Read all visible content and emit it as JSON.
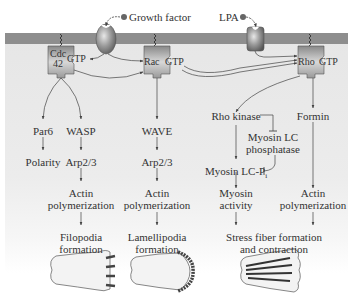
{
  "ligands": {
    "growth_factor": "Growth factor",
    "lpa": "LPA"
  },
  "gtpases": {
    "cdc42": {
      "name_line1": "Cdc",
      "name_line2": "42",
      "state": "GTP"
    },
    "rac": {
      "name": "Rac",
      "state": "GTP"
    },
    "rho": {
      "name": "Rho",
      "state": "GTP"
    }
  },
  "cdc42_pathway": {
    "par6": "Par6",
    "polarity": "Polarity",
    "wasp": "WASP",
    "arp23": "Arp2/3",
    "actin_line1": "Actin",
    "actin_line2": "polymerization",
    "outcome_line1": "Filopodia",
    "outcome_line2": "formation"
  },
  "rac_pathway": {
    "wave": "WAVE",
    "arp23": "Arp2/3",
    "actin_line1": "Actin",
    "actin_line2": "polymerization",
    "outcome_line1": "Lamellipodia",
    "outcome_line2": "formation"
  },
  "rho_pathway": {
    "rho_kinase": "Rho kinase",
    "phosphatase_line1": "Myosin LC",
    "phosphatase_line2": "phosphatase",
    "myosin_lcp": "Myosin LC-P",
    "myosin_lcp_sub": "i",
    "myosin_line1": "Myosin",
    "myosin_line2": "activity",
    "formin": "Formin",
    "actin_line1": "Actin",
    "actin_line2": "polymerization",
    "outcome_line1": "Stress fiber formation",
    "outcome_line2": "and contraction"
  }
}
